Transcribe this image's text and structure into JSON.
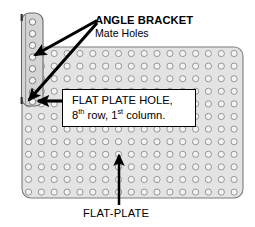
{
  "diagram": {
    "type": "mechanical-parts-diagram",
    "colors": {
      "plate_fill": "#e2e2e2",
      "plate_stroke": "#7d7d7d",
      "bracket_fill": "#d2d2d2",
      "bracket_stroke": "#6a6a6a",
      "hole_stroke": "#8d8d8d",
      "hole_fill": "#f2f2f2",
      "arrow": "#000000",
      "callout_border": "#000000",
      "callout_fill": "#ffffff",
      "text": "#000000"
    }
  },
  "labels": {
    "angle_bracket_title": "ANGLE BRACKET",
    "angle_bracket_subtitle": "Mate Holes",
    "flat_plate": "FLAT-PLATE"
  },
  "callout": {
    "line_1": "FLAT PLATE HOLE,",
    "row_number": "8",
    "row_ordinal": "th",
    "row_word": " row, ",
    "column_number": "1",
    "column_ordinal": "st",
    "column_word": " column."
  },
  "flat_plate": {
    "name": "FLAT-PLATE",
    "hole_columns": 17,
    "hole_rows": 12,
    "bounds": {
      "x": 22,
      "y": 47,
      "width": 221,
      "height": 151
    },
    "corner_radius": 9,
    "hole_radius": 3.1,
    "col_spacing": 12.85,
    "row_spacing": 12.6,
    "first_hole_x": 28.5,
    "first_hole_y": 53.5
  },
  "angle_bracket": {
    "name": "ANGLE BRACKET",
    "hole_count": 8,
    "bounds": {
      "x": 21,
      "y": 13,
      "width": 22,
      "height": 93
    },
    "corner_radius": 8,
    "hole_radius": 3.1,
    "hole_center_x": 32,
    "first_hole_y": 22,
    "row_spacing": 11.7
  },
  "annotations": {
    "bracket_arrow_upper": {
      "from_x": 97,
      "from_y": 20,
      "to_x": 33,
      "to_y": 56
    },
    "bracket_arrow_lower": {
      "from_x": 97,
      "from_y": 22,
      "to_x": 27,
      "to_y": 101
    },
    "callout_arrow": {
      "from_x": 62,
      "from_y": 101,
      "to_x": 36,
      "to_y": 101
    },
    "flat_plate_arrow": {
      "from_x": 119,
      "from_y": 205,
      "to_x": 119,
      "to_y": 156
    }
  }
}
